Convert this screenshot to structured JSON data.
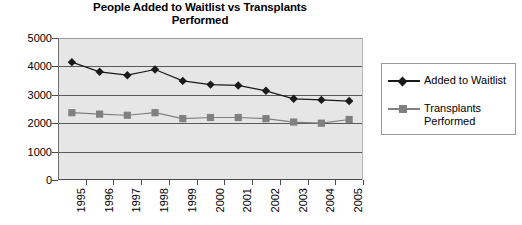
{
  "chart_data": {
    "type": "line",
    "title": "People Added to Waitlist vs Transplants Performed",
    "title_line1": "People Added to Waitlist vs Transplants",
    "title_line2": "Performed",
    "xlabel": "",
    "ylabel": "",
    "categories": [
      "1995",
      "1996",
      "1997",
      "1998",
      "1999",
      "2000",
      "2001",
      "2002",
      "2003",
      "2004",
      "2005"
    ],
    "ylim": [
      0,
      5000
    ],
    "ytick_labels": [
      "5000",
      "4000",
      "3000",
      "2000",
      "1000",
      "0"
    ],
    "ytick_values": [
      5000,
      4000,
      3000,
      2000,
      1000,
      0
    ],
    "grid": true,
    "legend_position": "right",
    "series": [
      {
        "name": "Added to Waitlist",
        "marker": "diamond",
        "color": "#1a1a1a",
        "values": [
          4150,
          3810,
          3690,
          3890,
          3490,
          3360,
          3330,
          3140,
          2860,
          2820,
          2780
        ]
      },
      {
        "name": "Transplants Performed",
        "marker": "square",
        "color": "#808080",
        "values": [
          2370,
          2320,
          2280,
          2370,
          2160,
          2200,
          2200,
          2160,
          2040,
          2000,
          2130
        ]
      }
    ]
  },
  "legend": {
    "entries": [
      {
        "label": "Added to Waitlist"
      },
      {
        "label": "Transplants Performed"
      }
    ]
  }
}
